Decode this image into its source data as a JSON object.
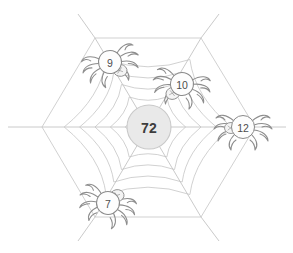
{
  "puzzle": {
    "kind": "spider-web-number-puzzle",
    "center": {
      "label": "72",
      "fill_color": "#e9e9e9",
      "text_color": "#3d3d3d"
    },
    "web": {
      "line_color": "#bdbdbd",
      "ring_count": 6,
      "spoke_count": 6,
      "shape": "hexagonal"
    },
    "spiders": [
      {
        "id": "spider-top-left",
        "label": "9",
        "cx": 110,
        "cy": 62,
        "r": 11.5,
        "rotation": -20
      },
      {
        "id": "spider-top-right",
        "label": "10",
        "cx": 182,
        "cy": 84,
        "r": 11.5,
        "rotation": 15
      },
      {
        "id": "spider-right",
        "label": "12",
        "cx": 243,
        "cy": 127,
        "r": 11.5,
        "rotation": 0
      },
      {
        "id": "spider-bottom-left",
        "label": "7",
        "cx": 108,
        "cy": 203,
        "r": 11.5,
        "rotation": 25
      }
    ],
    "icons": {
      "spider": "spider-icon",
      "web": "spider-web-icon"
    }
  }
}
